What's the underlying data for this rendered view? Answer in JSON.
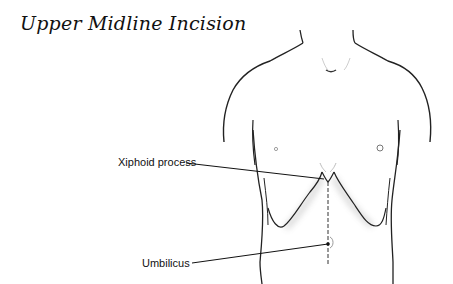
{
  "title": "Upper Midline Incision",
  "labels": {
    "xiphoid": "Xiphoid process",
    "umbilicus": "Umbilicus"
  },
  "colors": {
    "line": "#222222",
    "background": "#ffffff"
  }
}
